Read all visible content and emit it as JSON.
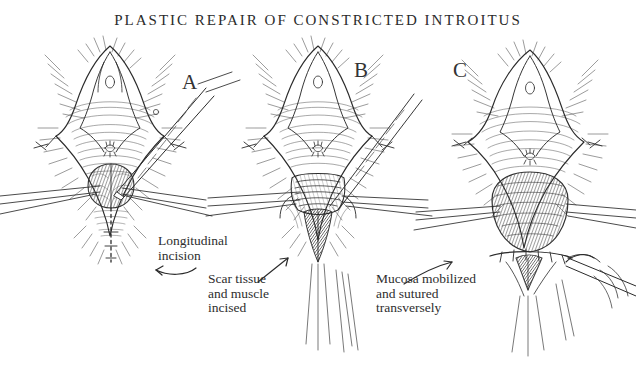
{
  "plate": {
    "title": "PLASTIC REPAIR OF CONSTRICTED INTROITUS",
    "medium": "pen-and-ink line drawing",
    "background_color": "#ffffff",
    "ink_color": "#2b2b2b"
  },
  "panels": [
    {
      "id": "a",
      "label": "A",
      "description": "Vulvar introitus held open by stay sutures at the lateral margins; a scalpel held from upper right makes a vertical midline incision in the posterior fourchette. A dotted line marks the planned longitudinal incision below.",
      "instruments": [
        "scalpel",
        "stay-suture",
        "retracting-forceps"
      ]
    },
    {
      "id": "b",
      "label": "B",
      "description": "The incision has been deepened; scar tissue and muscle are divided and the wound edges gape transversely. Forceps enter from both sides holding the divided edges apart.",
      "instruments": [
        "forceps-left",
        "forceps-right",
        "stay-suture"
      ]
    },
    {
      "id": "c",
      "label": "C",
      "description": "Vaginal mucosa has been undermined, advanced and sutured transversely, widening the introitus. A needle holder with curved needle places the closing suture at lower right.",
      "instruments": [
        "needle-holder",
        "curved-needle",
        "forceps-left",
        "forceps-right"
      ]
    }
  ],
  "captions": [
    {
      "id": "longitudinal-incision",
      "text": "Longitudinal\nincision",
      "arrow": "curved-left"
    },
    {
      "id": "scar-tissue-incised",
      "text": "Scar tissue\nand muscle\nincised",
      "arrow": "straight-up-right"
    },
    {
      "id": "mucosa-sutured",
      "text": "Mucosa mobilized\nand sutured\ntransversely",
      "arrow": "curved-up-right"
    }
  ]
}
